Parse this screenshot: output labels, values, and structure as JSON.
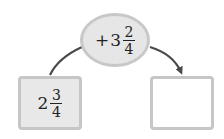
{
  "operation": {
    "sign": "+",
    "whole": "3",
    "numerator": "2",
    "denominator": "4"
  },
  "start_value": {
    "whole": "2",
    "numerator": "3",
    "denominator": "4"
  },
  "result_value": {
    "whole": "",
    "numerator": "",
    "denominator": ""
  },
  "colors": {
    "oval_fill": "#e6e6e6",
    "oval_border": "#c8c8c8",
    "box_border": "#c6c6c6",
    "start_box_fill": "#e8e8e8",
    "result_box_fill": "#ffffff",
    "arrow": "#4a4a4a"
  }
}
